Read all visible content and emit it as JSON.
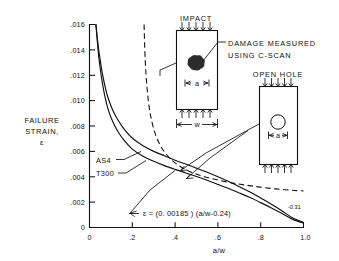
{
  "figure": {
    "y_axis_title_lines": [
      "FAILURE",
      "STRAIN,",
      "ε"
    ],
    "x_axis_title": "a/w"
  },
  "axes": {
    "x_ticks": [
      "0",
      ".2",
      ".4",
      ".6",
      ".8",
      "1.0"
    ],
    "y_ticks": [
      "0",
      ".002",
      ".004",
      ".006",
      ".008",
      ".010",
      ".012",
      ".014",
      ".016"
    ]
  },
  "curve_labels": {
    "as4": "AS4",
    "t300": "T300"
  },
  "equation": {
    "lhs": "ε  =  (0. 00185 ) (a/w-0.24)",
    "exponent": "-0.31"
  },
  "diagrams": {
    "impact": {
      "title": "IMPACT",
      "dim_a": "a",
      "dim_w": "w",
      "callout": [
        "DAMAGE MEASURED",
        "USING C-SCAN"
      ]
    },
    "open_hole": {
      "title": "OPEN HOLE",
      "dim_a": "a"
    }
  },
  "chart_data": {
    "type": "line",
    "title": "",
    "xlabel": "a/w",
    "ylabel": "FAILURE STRAIN, ε",
    "xlim": [
      0,
      1.0
    ],
    "ylim": [
      0,
      0.016
    ],
    "grid": false,
    "legend": "inline-labels",
    "series": [
      {
        "name": "AS4",
        "style": "solid",
        "x": [
          0.03,
          0.04,
          0.05,
          0.06,
          0.075,
          0.09,
          0.11,
          0.13,
          0.16,
          0.2,
          0.25,
          0.3,
          0.35,
          0.4,
          0.45,
          0.5,
          0.55,
          0.6,
          0.65,
          0.7,
          0.75,
          0.8,
          0.85,
          0.9,
          0.95,
          1.0
        ],
        "y": [
          0.016,
          0.0144,
          0.0132,
          0.01215,
          0.01095,
          0.01005,
          0.0092,
          0.00855,
          0.0078,
          0.00705,
          0.00645,
          0.006,
          0.00565,
          0.0053,
          0.005,
          0.00468,
          0.00435,
          0.004,
          0.00362,
          0.00322,
          0.0028,
          0.00232,
          0.00183,
          0.0013,
          0.00075,
          0.0004
        ]
      },
      {
        "name": "T300",
        "style": "solid",
        "x": [
          0.03,
          0.04,
          0.05,
          0.06,
          0.075,
          0.09,
          0.11,
          0.13,
          0.16,
          0.2,
          0.25,
          0.3,
          0.35,
          0.4,
          0.45,
          0.5,
          0.55,
          0.6,
          0.65,
          0.7,
          0.75,
          0.8,
          0.85,
          0.9,
          0.95,
          1.0
        ],
        "y": [
          0.016,
          0.014,
          0.01255,
          0.0114,
          0.0101,
          0.00915,
          0.0083,
          0.00765,
          0.0069,
          0.00618,
          0.00562,
          0.00522,
          0.00488,
          0.00458,
          0.0043,
          0.00402,
          0.00372,
          0.0034,
          0.00307,
          0.00272,
          0.00236,
          0.00196,
          0.00154,
          0.0011,
          0.00064,
          0.00035
        ]
      },
      {
        "name": "open-hole-prediction",
        "style": "dashed",
        "x": [
          0.255,
          0.26,
          0.268,
          0.278,
          0.292,
          0.31,
          0.33,
          0.355,
          0.385,
          0.42,
          0.46,
          0.505,
          0.555,
          0.61,
          0.67,
          0.73,
          0.79,
          0.85,
          0.91,
          0.96,
          1.0
        ],
        "y": [
          0.016,
          0.0133,
          0.0112,
          0.0096,
          0.0083,
          0.00725,
          0.0065,
          0.00585,
          0.0053,
          0.00485,
          0.00448,
          0.00418,
          0.00392,
          0.0037,
          0.0035,
          0.00334,
          0.0032,
          0.00308,
          0.00298,
          0.00292,
          0.00288
        ]
      }
    ],
    "annotations": [
      {
        "text": "AS4",
        "x": 0.115,
        "y": 0.0055
      },
      {
        "text": "T300",
        "x": 0.115,
        "y": 0.0042
      },
      {
        "text": "ε = (0. 00185 ) (a/w-0.24)^-0.31",
        "x": 0.3,
        "y": 0.0012
      }
    ]
  }
}
